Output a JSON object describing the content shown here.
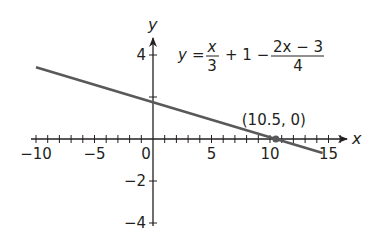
{
  "chart_data": {
    "type": "line",
    "title": "",
    "xlabel": "x",
    "ylabel": "y",
    "xlim": [
      -10.5,
      16.5
    ],
    "ylim": [
      -4.3,
      4.8
    ],
    "x_tick_labels": [
      "-10",
      "-5",
      "0",
      "5",
      "10",
      "15"
    ],
    "x_tick_label_values": [
      -10,
      -5,
      0,
      5,
      10,
      15
    ],
    "x_minor_tick_step": 1,
    "y_tick_labels": [
      "4",
      "-2",
      "-4"
    ],
    "y_tick_label_values": [
      4,
      -2,
      -4
    ],
    "y_ticks": [
      4,
      2,
      -2,
      -4
    ],
    "grid": false,
    "series": [
      {
        "name": "y = x/3 + 1 - (2x - 3)/4",
        "equation": "y = -x/6 + 1.75",
        "x": [
          -10,
          14.5
        ],
        "y": [
          3.42,
          -0.67
        ],
        "color": "#58595b"
      }
    ],
    "annotations": [
      {
        "text": "(10.5, 0)",
        "x": 10.5,
        "y": 0,
        "marker": "dot"
      }
    ],
    "equation_label": {
      "lhs": "y",
      "eq": "=",
      "frac1_num": "x",
      "frac1_den": "3",
      "middle": "+ 1 −",
      "frac2_num": "2x − 3",
      "frac2_den": "4"
    }
  }
}
